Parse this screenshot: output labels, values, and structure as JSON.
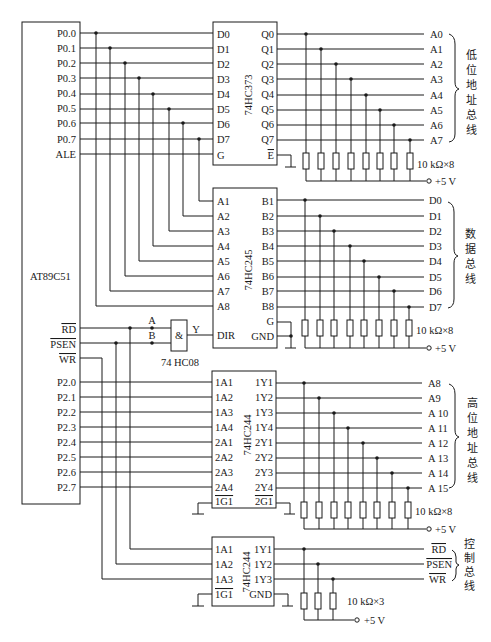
{
  "diagram": {
    "mcu": {
      "name": "AT89C51",
      "p0_pins": [
        "P0.0",
        "P0.1",
        "P0.2",
        "P0.3",
        "P0.4",
        "P0.5",
        "P0.6",
        "P0.7"
      ],
      "ale": "ALE",
      "rd": "RD",
      "psen": "PSEN",
      "wr": "WR",
      "p2_pins": [
        "P2.0",
        "P2.1",
        "P2.2",
        "P2.3",
        "P2.4",
        "P2.5",
        "P2.6",
        "P2.7"
      ]
    },
    "latch": {
      "name": "74HC373",
      "inputs": [
        "D0",
        "D1",
        "D2",
        "D3",
        "D4",
        "D5",
        "D6",
        "D7",
        "G"
      ],
      "outputs": [
        "Q0",
        "Q1",
        "Q2",
        "Q3",
        "Q4",
        "Q5",
        "Q6",
        "Q7",
        "E"
      ],
      "bus_lines": [
        "A0",
        "A1",
        "A2",
        "A3",
        "A4",
        "A5",
        "A6",
        "A7"
      ],
      "bus_name": [
        "低",
        "位",
        "地",
        "址",
        "总",
        "线"
      ],
      "pullup": "10 kΩ×8",
      "vcc": "+5 V"
    },
    "transceiver": {
      "name": "74HC245",
      "inputs": [
        "A1",
        "A2",
        "A3",
        "A4",
        "A5",
        "A6",
        "A7",
        "A8",
        "DIR"
      ],
      "outputs": [
        "B1",
        "B2",
        "B3",
        "B4",
        "B5",
        "B6",
        "B7",
        "B8",
        "G",
        "GND"
      ],
      "bus_lines": [
        "D0",
        "D1",
        "D2",
        "D3",
        "D4",
        "D5",
        "D6",
        "D7"
      ],
      "bus_name": [
        "数",
        "据",
        "总",
        "线"
      ],
      "pullup": "10 kΩ×8",
      "vcc": "+5 V"
    },
    "and_gate": {
      "name": "74 HC08",
      "symbol": "&",
      "in_a": "A",
      "in_b": "B",
      "out": "Y"
    },
    "buffer_high": {
      "name": "74HC244",
      "inputs": [
        "1A1",
        "1A2",
        "1A3",
        "1A4",
        "2A1",
        "2A2",
        "2A3",
        "2A4",
        "1G1"
      ],
      "outputs": [
        "1Y1",
        "1Y2",
        "1Y3",
        "1Y4",
        "2Y1",
        "2Y2",
        "2Y3",
        "2Y4",
        "2G1"
      ],
      "bus_lines": [
        "A8",
        "A9",
        "A 10",
        "A 11",
        "A 12",
        "A 13",
        "A 14",
        "A 15"
      ],
      "bus_name": [
        "高",
        "位",
        "地",
        "址",
        "总",
        "线"
      ],
      "pullup": "10 kΩ×8",
      "vcc": "+5 V"
    },
    "buffer_ctrl": {
      "name": "74HC244",
      "inputs": [
        "1A1",
        "1A2",
        "1A3",
        "1G1"
      ],
      "outputs": [
        "1Y1",
        "1Y2",
        "1Y3",
        "GND"
      ],
      "bus_lines": [
        "RD",
        "PSEN",
        "WR"
      ],
      "bus_name": [
        "控",
        "制",
        "总",
        "线"
      ],
      "pullup": "10 kΩ×3",
      "vcc": "+5 V"
    }
  }
}
